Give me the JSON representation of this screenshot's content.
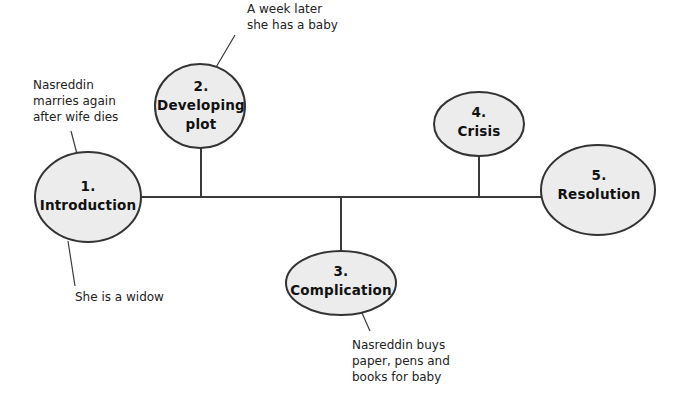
{
  "diagram": {
    "type": "story-structure-timeline",
    "colors": {
      "ellipse_fill": "#ececec",
      "ellipse_stroke": "#333333",
      "line": "#3a3a3a",
      "text": "#111111",
      "background": "#ffffff"
    },
    "nodes": [
      {
        "id": "introduction",
        "number": "1.",
        "title_lines": [
          "Introduction"
        ]
      },
      {
        "id": "developing-plot",
        "number": "2.",
        "title_lines": [
          "Developing",
          "plot"
        ]
      },
      {
        "id": "complication",
        "number": "3.",
        "title_lines": [
          "Complication"
        ]
      },
      {
        "id": "crisis",
        "number": "4.",
        "title_lines": [
          "Crisis"
        ]
      },
      {
        "id": "resolution",
        "number": "5.",
        "title_lines": [
          "Resolution"
        ]
      }
    ],
    "callouts": [
      {
        "id": "intro-above",
        "attached_to": "introduction",
        "lines": [
          "Nasreddin",
          "marries again",
          "after wife dies"
        ]
      },
      {
        "id": "intro-below",
        "attached_to": "introduction",
        "lines": [
          "She is a widow"
        ]
      },
      {
        "id": "developing-plot-above",
        "attached_to": "developing-plot",
        "lines": [
          "A week later",
          "she has a baby"
        ]
      },
      {
        "id": "complication-below",
        "attached_to": "complication",
        "lines": [
          "Nasreddin buys",
          "paper, pens and",
          "books for baby"
        ]
      }
    ]
  }
}
